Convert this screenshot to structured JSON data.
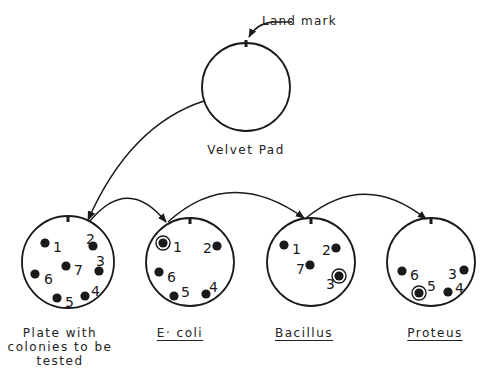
{
  "diagram": {
    "type": "replica-plating-procedure",
    "landmark_label": "Land mark",
    "velvet_pad_label": "Velvet Pad",
    "velvet_pad": {
      "cx": 246,
      "cy": 87,
      "r": 44
    },
    "plates": [
      {
        "id": "master",
        "label_lines": [
          "Plate with",
          "colonies to be",
          "tested"
        ],
        "underlined": false,
        "cx": 68,
        "cy": 262,
        "r": 46,
        "colonies": [
          {
            "n": "1",
            "x": 45,
            "y": 243,
            "lx": 53,
            "ly": 248,
            "ringed": false
          },
          {
            "n": "2",
            "x": 93,
            "y": 246,
            "lx": 86,
            "ly": 240,
            "ringed": false
          },
          {
            "n": "3",
            "x": 99,
            "y": 271,
            "lx": 96,
            "ly": 262,
            "ringed": false
          },
          {
            "n": "4",
            "x": 85,
            "y": 296,
            "lx": 91,
            "ly": 292,
            "ringed": false
          },
          {
            "n": "5",
            "x": 57,
            "y": 298,
            "lx": 65,
            "ly": 303,
            "ringed": false
          },
          {
            "n": "6",
            "x": 35,
            "y": 274,
            "lx": 44,
            "ly": 280,
            "ringed": false
          },
          {
            "n": "7",
            "x": 66,
            "y": 266,
            "lx": 74,
            "ly": 271,
            "ringed": false
          }
        ]
      },
      {
        "id": "ecoli",
        "label_lines": [
          "E· coli"
        ],
        "underlined": true,
        "cx": 190,
        "cy": 262,
        "r": 44,
        "colonies": [
          {
            "n": "1",
            "x": 163,
            "y": 243,
            "lx": 173,
            "ly": 248,
            "ringed": true
          },
          {
            "n": "2",
            "x": 217,
            "y": 246,
            "lx": 203,
            "ly": 249,
            "ringed": false
          },
          {
            "n": "4",
            "x": 206,
            "y": 294,
            "lx": 209,
            "ly": 288,
            "ringed": false
          },
          {
            "n": "5",
            "x": 174,
            "y": 296,
            "lx": 181,
            "ly": 293,
            "ringed": false
          },
          {
            "n": "6",
            "x": 159,
            "y": 272,
            "lx": 167,
            "ly": 278,
            "ringed": false
          }
        ]
      },
      {
        "id": "bacillus",
        "label_lines": [
          "Bacillus"
        ],
        "underlined": true,
        "cx": 311,
        "cy": 262,
        "r": 44,
        "colonies": [
          {
            "n": "1",
            "x": 284,
            "y": 245,
            "lx": 292,
            "ly": 250,
            "ringed": false
          },
          {
            "n": "2",
            "x": 336,
            "y": 248,
            "lx": 322,
            "ly": 251,
            "ringed": false
          },
          {
            "n": "3",
            "x": 339,
            "y": 276,
            "lx": 326,
            "ly": 285,
            "ringed": true
          },
          {
            "n": "7",
            "x": 310,
            "y": 265,
            "lx": 296,
            "ly": 270,
            "ringed": false
          }
        ]
      },
      {
        "id": "proteus",
        "label_lines": [
          "Proteus"
        ],
        "underlined": true,
        "cx": 431,
        "cy": 262,
        "r": 44,
        "colonies": [
          {
            "n": "3",
            "x": 464,
            "y": 270,
            "lx": 448,
            "ly": 275,
            "ringed": false
          },
          {
            "n": "4",
            "x": 448,
            "y": 292,
            "lx": 455,
            "ly": 289,
            "ringed": false
          },
          {
            "n": "5",
            "x": 419,
            "y": 293,
            "lx": 427,
            "ly": 287,
            "ringed": true
          },
          {
            "n": "6",
            "x": 402,
            "y": 271,
            "lx": 410,
            "ly": 276,
            "ringed": false
          }
        ]
      }
    ]
  }
}
